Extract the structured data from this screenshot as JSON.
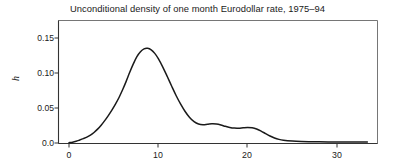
{
  "chart_data": {
    "type": "line",
    "title": "Unconditional density of one month Eurodollar rate, 1975–94",
    "xlabel": "",
    "ylabel": "h",
    "xlim": [
      -0.6,
      35.2
    ],
    "ylim": [
      -0.004,
      0.168
    ],
    "xticks": [
      0,
      10,
      20,
      30
    ],
    "xtick_labels": [
      "0",
      "10",
      "20",
      "30"
    ],
    "yticks": [
      0.0,
      0.05,
      0.1,
      0.15
    ],
    "ytick_labels": [
      "0.0",
      "0.05",
      "0.10",
      "0.15"
    ],
    "grid": false,
    "legend": null,
    "line_color": "#1a1a1a",
    "frame_color": "#555555",
    "series": [
      {
        "name": "Unconditional density",
        "x": [
          0.0,
          0.4,
          0.8,
          1.2,
          1.6,
          2.0,
          2.4,
          2.8,
          3.2,
          3.6,
          4.0,
          4.4,
          4.8,
          5.2,
          5.6,
          6.0,
          6.4,
          6.8,
          7.2,
          7.6,
          8.0,
          8.4,
          8.8,
          9.2,
          9.6,
          10.0,
          10.5,
          11.0,
          11.5,
          12.0,
          12.5,
          13.0,
          13.5,
          14.0,
          14.5,
          15.0,
          15.5,
          16.0,
          16.5,
          17.0,
          17.5,
          18.0,
          18.5,
          19.0,
          19.5,
          20.0,
          20.5,
          21.0,
          21.5,
          22.0,
          22.5,
          23.0,
          23.5,
          24.0,
          25.0,
          26.0,
          27.0,
          28.0,
          29.0,
          30.0,
          31.0,
          32.0,
          33.0,
          33.4
        ],
        "y": [
          0.0005,
          0.0012,
          0.0025,
          0.0043,
          0.0062,
          0.0083,
          0.0112,
          0.015,
          0.0198,
          0.0255,
          0.032,
          0.0392,
          0.047,
          0.0555,
          0.065,
          0.076,
          0.088,
          0.101,
          0.113,
          0.1235,
          0.1305,
          0.1345,
          0.1352,
          0.133,
          0.128,
          0.1205,
          0.1085,
          0.095,
          0.081,
          0.0675,
          0.0555,
          0.045,
          0.0365,
          0.0305,
          0.0272,
          0.0262,
          0.0268,
          0.0275,
          0.0272,
          0.0258,
          0.0238,
          0.0222,
          0.0213,
          0.0212,
          0.0218,
          0.0222,
          0.0218,
          0.02,
          0.017,
          0.0135,
          0.01,
          0.0072,
          0.0052,
          0.004,
          0.0028,
          0.0022,
          0.0019,
          0.0017,
          0.0016,
          0.0015,
          0.0014,
          0.0013,
          0.0013,
          0.0013
        ]
      }
    ]
  },
  "axes": {
    "ytick_0": "0.0",
    "ytick_1": "0.05",
    "ytick_2": "0.10",
    "ytick_3": "0.15",
    "xtick_0": "0",
    "xtick_1": "10",
    "xtick_2": "20",
    "xtick_3": "30"
  }
}
